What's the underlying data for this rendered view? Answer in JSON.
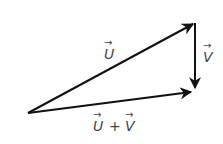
{
  "diagram": {
    "type": "vector-addition-triangle",
    "stroke_color": "#111111",
    "label_color": "#444444",
    "vectors": [
      {
        "name": "u",
        "label": "U",
        "from": [
          28,
          113
        ],
        "to": [
          195,
          23
        ]
      },
      {
        "name": "v",
        "label": "V",
        "from": [
          195,
          23
        ],
        "to": [
          195,
          90
        ]
      },
      {
        "name": "u_plus_v",
        "label": "U + V",
        "from": [
          28,
          113
        ],
        "to": [
          193,
          92
        ]
      }
    ],
    "labels": {
      "u": "U",
      "v": "V",
      "sum_u": "U",
      "sum_plus": "+",
      "sum_v": "V",
      "arrow_glyph": "→"
    }
  }
}
